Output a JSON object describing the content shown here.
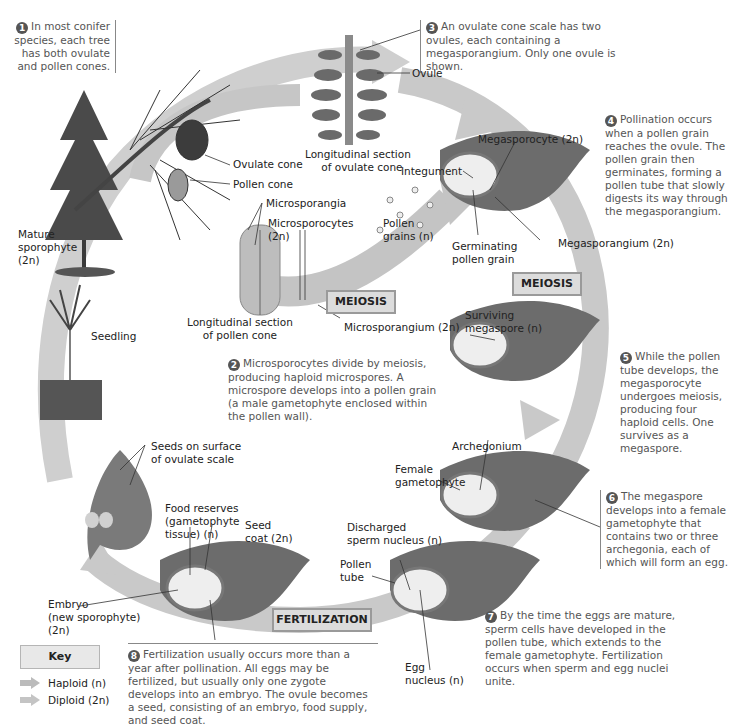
{
  "figure": {
    "colors": {
      "haploid_arrow": "#bdbdbd",
      "diploid_arrow": "#c8c8c8",
      "tissue": "#6e6e6e",
      "process_box_fill": "#dcdcdc",
      "step_number_fill": "#555555"
    }
  },
  "steps": [
    {
      "number": "1",
      "text": "In most conifer species, each tree has both ovulate and pollen cones."
    },
    {
      "number": "2",
      "text": "Microsporocytes divide by meiosis, producing haploid microspores. A microspore develops into a pollen grain (a male gametophyte enclosed within the pollen wall)."
    },
    {
      "number": "3",
      "text": "An ovulate cone scale has two ovules, each containing a megasporangium. Only one ovule is shown."
    },
    {
      "number": "4",
      "text": "Pollination occurs when a pollen grain reaches the ovule. The pollen grain then germinates, forming a pollen tube that slowly digests its way through the megasporangium."
    },
    {
      "number": "5",
      "text": "While the pollen tube develops, the megasporocyte undergoes meiosis, producing four haploid cells. One survives as a megaspore."
    },
    {
      "number": "6",
      "text": "The megaspore develops into a female gametophyte that contains two or three archegonia, each of which will form an egg."
    },
    {
      "number": "7",
      "text": "By the time the eggs are mature, sperm cells have developed in the pollen tube, which extends to the female gametophyte. Fertilization occurs when sperm and egg nuclei unite."
    },
    {
      "number": "8",
      "text": "Fertilization usually occurs more than a year after pollination. All eggs may be fertilized, but usually only one zygote develops into an embryo. The ovule becomes a seed, consisting of an embryo, food supply, and seed coat."
    }
  ],
  "labels": {
    "ovule": "Ovule",
    "long_section_ovulate_1": "Longitudinal section",
    "long_section_ovulate_2": "of ovulate cone",
    "ovulate_cone": "Ovulate cone",
    "pollen_cone": "Pollen cone",
    "microsporangia": "Microsporangia",
    "microsporocytes_1": "Microsporocytes",
    "microsporocytes_2": "(2n)",
    "pollen_grains_1": "Pollen",
    "pollen_grains_2": "grains (n)",
    "mature_sporophyte_1": "Mature",
    "mature_sporophyte_2": "sporophyte",
    "mature_sporophyte_3": "(2n)",
    "long_section_pollen_1": "Longitudinal section",
    "long_section_pollen_2": "of pollen cone",
    "microsporangium": "Microsporangium (2n)",
    "seedling": "Seedling",
    "megasporocyte": "Megasporocyte (2n)",
    "integument": "Integument",
    "megasporangium": "Megasporangium (2n)",
    "germinating_1": "Germinating",
    "germinating_2": "pollen grain",
    "surviving_1": "Surviving",
    "surviving_2": "megaspore (n)",
    "archegonium": "Archegonium",
    "female_gam_1": "Female",
    "female_gam_2": "gametophyte",
    "seeds_surface_1": "Seeds on surface",
    "seeds_surface_2": "of ovulate scale",
    "food_reserves_1": "Food reserves",
    "food_reserves_2": "(gametophyte",
    "food_reserves_3": "tissue) (n)",
    "seed_coat_1": "Seed",
    "seed_coat_2": "coat (2n)",
    "discharged_1": "Discharged",
    "discharged_2": "sperm nucleus (n)",
    "pollen_tube_1": "Pollen",
    "pollen_tube_2": "tube",
    "embryo_1": "Embryo",
    "embryo_2": "(new sporophyte)",
    "embryo_3": "(2n)",
    "egg_1": "Egg",
    "egg_2": "nucleus (n)"
  },
  "process_boxes": {
    "meiosis_male": "MEIOSIS",
    "meiosis_female": "MEIOSIS",
    "fertilization": "FERTILIZATION"
  },
  "key": {
    "title": "Key",
    "items": [
      {
        "label": "Haploid (n)",
        "icon": "light-arrow-icon"
      },
      {
        "label": "Diploid (2n)",
        "icon": "gray-arrow-icon"
      }
    ]
  }
}
